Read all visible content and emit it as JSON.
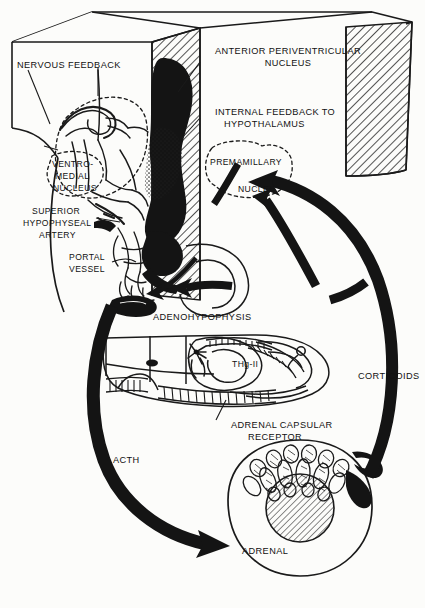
{
  "figure": {
    "background_color": "#fcfcfa",
    "ink_color": "#111111"
  },
  "labels": {
    "nervous_feedback": "NERVOUS FEEDBACK",
    "anterior_periventricular_nucleus_line1": "ANTERIOR PERIVENTRICULAR",
    "anterior_periventricular_nucleus_line2": "NUCLEUS",
    "internal_feedback_line1": "INTERNAL FEEDBACK TO",
    "internal_feedback_line2": "HYPOTHALAMUS",
    "ventromedial_nucleus_line1": "VENTRO-",
    "ventromedial_nucleus_line2": "MEDIAL",
    "ventromedial_nucleus_line3": "NUCLEUS",
    "premamillary": "PREMAMILLARY",
    "nuclei": "NUCLEI",
    "superior_hypophyseal_artery_line1": "SUPERIOR",
    "superior_hypophyseal_artery_line2": "HYPOPHYSEAL",
    "superior_hypophyseal_artery_line3": "ARTERY",
    "portal_vessel_line1": "PORTAL",
    "portal_vessel_line2": "VESSEL",
    "adenohypophysis": "ADENOHYPOPHYSIS",
    "thg_ii": "THg-II",
    "adrenal_capsular_receptor_line1": "ADRENAL CAPSULAR",
    "adrenal_capsular_receptor_line2": "RECEPTOR",
    "corticoids": "CORTICOIDS",
    "acth": "ACTH",
    "adrenal": "ADRENAL"
  },
  "structures": {
    "box": "3d-perspective-box",
    "hatched_panels": 2,
    "hypothalamus_mass": "dark-infundibulum",
    "dashed_outline_ventromedial": true,
    "dashed_outline_premamillary": true,
    "adrenal_medulla_hatched": true
  },
  "arrows": {
    "acth_pathway": "adenohypophysis-to-adrenal",
    "corticoids_pathway": "adrenal-to-hypothalamus",
    "internal_feedback_pathway": "adenohypophysis-to-hypothalamus"
  }
}
